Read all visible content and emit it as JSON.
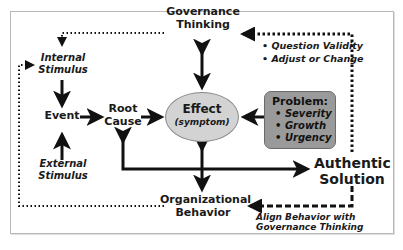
{
  "diagram": {
    "nodes": {
      "governance_thinking": "Governance\nThinking",
      "governance_line1": "Governance",
      "governance_line2": "Thinking",
      "internal_stimulus_line1": "Internal",
      "internal_stimulus_line2": "Stimulus",
      "event": "Event",
      "root_cause_line1": "Root",
      "root_cause_line2": "Cause",
      "external_stimulus_line1": "External",
      "external_stimulus_line2": "Stimulus",
      "effect_title": "Effect",
      "effect_subtitle": "(symptom)",
      "problem": {
        "title": "Problem:",
        "items": [
          "Severity",
          "Growth",
          "Urgency"
        ]
      },
      "authentic_solution_line1": "Authentic",
      "authentic_solution_line2": "Solution",
      "organizational_behavior_line1": "Organizational",
      "organizational_behavior_line2": "Behavior"
    },
    "annotations": {
      "feedback_bullets": [
        "Question Validity",
        "Adjust or Change"
      ],
      "align_line1": "Align Behavior with",
      "align_line2": "Governance Thinking"
    },
    "colors": {
      "frame_border": "#b8b8b8",
      "effect_fill": "#d3d3d3",
      "problem_fill": "#9a9a9a",
      "arrow": "#111111"
    }
  }
}
